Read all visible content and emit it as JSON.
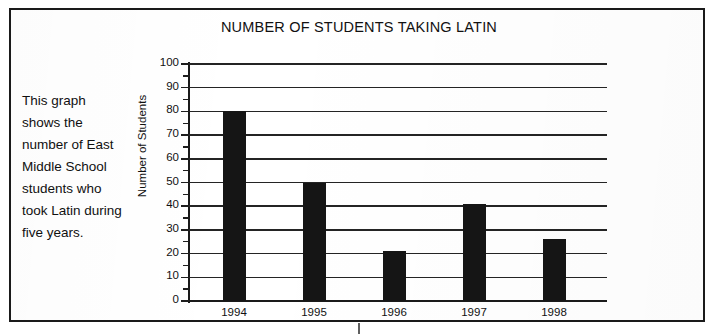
{
  "document": {
    "caption": "This graph shows the number of East Middle School students who took Latin during five years."
  },
  "chart_data": {
    "type": "bar",
    "title": "NUMBER OF STUDENTS TAKING LATIN",
    "xlabel": "",
    "ylabel": "Number of Students",
    "categories": [
      "1994",
      "1995",
      "1996",
      "1997",
      "1998"
    ],
    "values": [
      80,
      50,
      21,
      41,
      26
    ],
    "series": [
      {
        "name": "Number of Students",
        "values": [
          80,
          50,
          21,
          41,
          26
        ]
      }
    ],
    "ylim": [
      0,
      100
    ],
    "ytick_step": 10,
    "yminor_step": 5,
    "ytick_labels": [
      "0",
      "10",
      "20",
      "30",
      "40",
      "50",
      "60",
      "70",
      "80",
      "90",
      "100"
    ],
    "grid": "horizontal",
    "legend": "none",
    "bar_color": "#151515",
    "gridline_color": "#242424",
    "axis_color": "#1a1a1a",
    "background_color": "#ffffff"
  }
}
